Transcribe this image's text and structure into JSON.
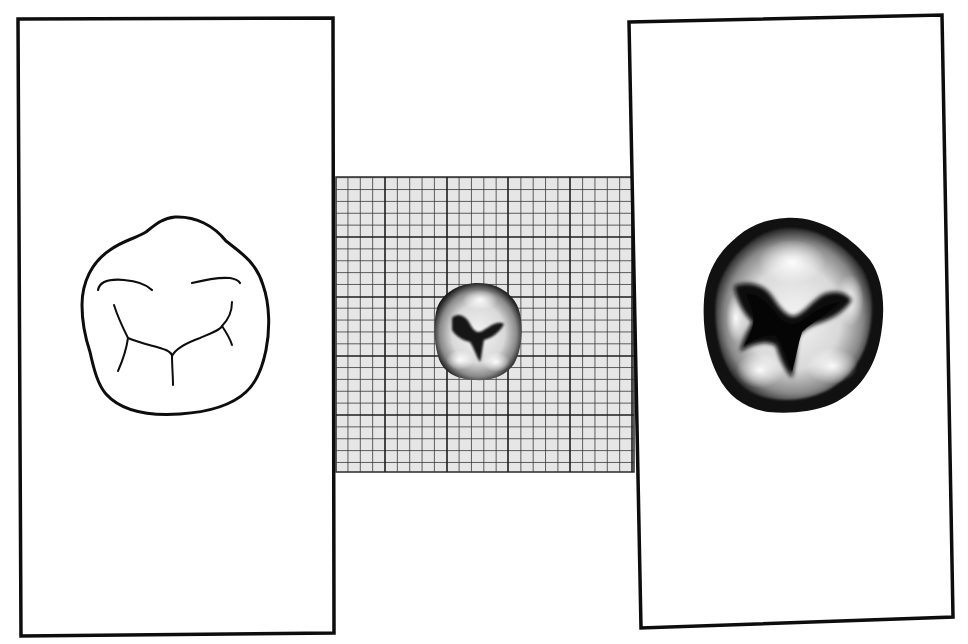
{
  "figure": {
    "background_color": "#ffffff",
    "ink_color": "#0d0d0d",
    "panels": [
      {
        "id": "left",
        "kind": "line-drawing",
        "subject": "occlusal outline of molar crown with fissure lines",
        "frame": {
          "x1": 18,
          "y1": 19,
          "x2": 334,
          "y2": 635,
          "stroke_width": 3.5
        }
      },
      {
        "id": "center",
        "kind": "photo-on-graph-paper",
        "subject": "molar occlusal photograph at actual size on millimetre grid",
        "grid": {
          "x": 336,
          "y": 177,
          "width": 298,
          "height": 295,
          "major_x": [
            385,
            447,
            508,
            570,
            632
          ],
          "major_y": [
            237,
            297,
            356,
            415
          ],
          "minor_divisions": 5,
          "paper_color": "#e6e6e6",
          "line_color": "#3a3a3a"
        },
        "tooth": {
          "cx": 478,
          "cy": 331,
          "rx": 44,
          "ry": 48
        }
      },
      {
        "id": "right",
        "kind": "enlarged-photo",
        "subject": "enlarged occlusal photograph of the same molar",
        "frame_points": "629,22 942,15 953,617 641,628",
        "stroke_width": 3.5,
        "tooth": {
          "cx": 791,
          "cy": 316,
          "rx": 90,
          "ry": 100
        }
      }
    ]
  }
}
